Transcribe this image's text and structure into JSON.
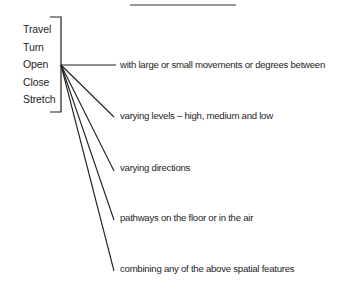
{
  "diagram": {
    "actions": [
      "Travel",
      "Turn",
      "Open",
      "Close",
      "Stretch"
    ],
    "features": [
      "with large or small movements or degrees between",
      "varying levels – high, medium and low",
      "varying directions",
      "pathways on the floor or in the air",
      "combining any of the above spatial features"
    ],
    "line_color": "#1e1e1e"
  }
}
